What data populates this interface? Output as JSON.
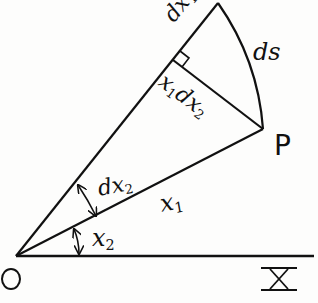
{
  "diagram": {
    "type": "geometry",
    "points": {
      "origin": {
        "label": "O",
        "x": 16,
        "y": 256
      },
      "P": {
        "label": "P",
        "x": 263,
        "y": 129
      },
      "top": {
        "x": 218,
        "y": 3
      },
      "foot": {
        "x": 173,
        "y": 60
      },
      "x_axis_end": {
        "x": 314,
        "y": 256
      }
    },
    "labels": {
      "dx1": {
        "base": "dx",
        "sub": "1"
      },
      "ds": "ds",
      "x1dx2": {
        "base1": "x",
        "sub1": "1",
        "base2": "dx",
        "sub2": "2"
      },
      "P": "P",
      "dx2": {
        "base": "dx",
        "sub": "2"
      },
      "x1": {
        "base": "x",
        "sub": "1"
      },
      "x2": {
        "base": "x",
        "sub": "2"
      },
      "O": "O",
      "X": "X"
    },
    "colors": {
      "ink": "#111111",
      "paper": "#fdfdfc"
    }
  }
}
